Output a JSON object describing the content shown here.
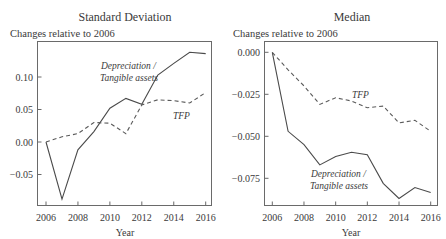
{
  "chart_data": [
    {
      "type": "line",
      "title": "Standard Deviation",
      "subtitle": "Changes relative to 2006",
      "xlabel": "Year",
      "ylabel": "",
      "x": [
        2006,
        2007,
        2008,
        2009,
        2010,
        2011,
        2012,
        2013,
        2014,
        2015,
        2016
      ],
      "xticks": [
        2006,
        2008,
        2010,
        2012,
        2014,
        2016
      ],
      "yticks": [
        -0.05,
        0.0,
        0.05,
        0.1
      ],
      "ytick_labels": [
        "−0.05",
        "0.00",
        "0.05",
        "0.10"
      ],
      "ylim": [
        -0.095,
        0.15
      ],
      "grid": false,
      "legend": "inline annotations",
      "series": [
        {
          "name": "Depreciation / Tangible assets",
          "style": "solid",
          "values": [
            0.0,
            -0.088,
            -0.012,
            0.016,
            0.052,
            0.067,
            0.058,
            0.103,
            0.121,
            0.138,
            0.136
          ]
        },
        {
          "name": "TFP",
          "style": "dashed",
          "values": [
            0.0,
            0.008,
            0.013,
            0.03,
            0.029,
            0.013,
            0.057,
            0.065,
            0.0635,
            0.06,
            0.076
          ]
        }
      ],
      "annotations": [
        {
          "text_lines": [
            "Depreciation /",
            "Tangible assets"
          ],
          "series": "Depreciation / Tangible assets"
        },
        {
          "text_lines": [
            "TFP"
          ],
          "series": "TFP"
        }
      ]
    },
    {
      "type": "line",
      "title": "Median",
      "subtitle": "Changes relative to 2006",
      "xlabel": "Year",
      "ylabel": "",
      "x": [
        2006,
        2007,
        2008,
        2009,
        2010,
        2011,
        2012,
        2013,
        2014,
        2015,
        2016
      ],
      "xticks": [
        2006,
        2008,
        2010,
        2012,
        2014,
        2016
      ],
      "yticks": [
        -0.075,
        -0.05,
        -0.025,
        0.0
      ],
      "ytick_labels": [
        "−0.075",
        "−0.050",
        "−0.025",
        "0.000"
      ],
      "ylim": [
        -0.091,
        0.006
      ],
      "grid": false,
      "legend": "inline annotations",
      "series": [
        {
          "name": "Depreciation / Tangible assets",
          "style": "solid",
          "values": [
            0.0,
            -0.047,
            -0.055,
            -0.067,
            -0.062,
            -0.0595,
            -0.061,
            -0.078,
            -0.087,
            -0.0805,
            -0.0835
          ]
        },
        {
          "name": "TFP",
          "style": "dashed",
          "values": [
            0.0,
            -0.0105,
            -0.02,
            -0.031,
            -0.027,
            -0.029,
            -0.033,
            -0.032,
            -0.042,
            -0.0405,
            -0.047
          ]
        }
      ],
      "annotations": [
        {
          "text_lines": [
            "Depreciation /",
            "Tangible assets"
          ],
          "series": "Depreciation / Tangible assets"
        },
        {
          "text_lines": [
            "TFP"
          ],
          "series": "TFP"
        }
      ]
    }
  ]
}
